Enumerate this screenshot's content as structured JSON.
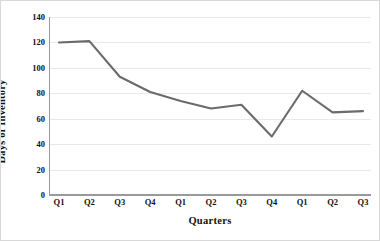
{
  "chart_data": {
    "type": "line",
    "title": "",
    "xlabel": "Quarters",
    "ylabel": "Days of Inventory",
    "categories": [
      "Q1",
      "Q2",
      "Q3",
      "Q4",
      "Q1",
      "Q2",
      "Q3",
      "Q4",
      "Q1",
      "Q2",
      "Q3"
    ],
    "values": [
      120,
      121,
      93,
      81,
      74,
      68,
      71,
      46,
      82,
      65,
      66
    ],
    "series": [
      {
        "name": "Days of Inventory",
        "values": [
          120,
          121,
          93,
          81,
          74,
          68,
          71,
          46,
          82,
          65,
          66
        ]
      }
    ],
    "ylim": [
      0,
      140
    ],
    "yticks": [
      0,
      20,
      40,
      60,
      80,
      100,
      120,
      140
    ],
    "ytick_labels": [
      "0",
      "20",
      "40",
      "60",
      "80",
      "100",
      "120",
      "140"
    ],
    "grid": "horizontal",
    "legend": "none",
    "line_color": "#6b6b6b",
    "grid_color": "#e9e9e9",
    "axis_color": "#9a9a9a",
    "background_color": "#ffffff",
    "markers": false
  }
}
